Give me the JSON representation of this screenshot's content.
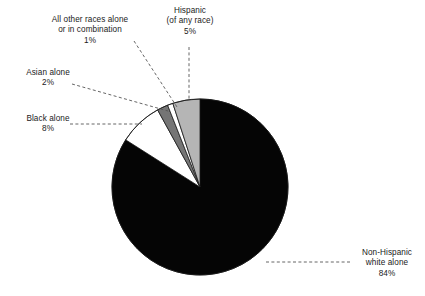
{
  "chart_data": {
    "type": "pie",
    "title": "",
    "subtitle": "",
    "xlabel": "",
    "ylabel": "",
    "legend_position": "callout-labels",
    "grid": false,
    "start_angle_deg": 0,
    "direction": "clockwise",
    "categories": [
      "Non-Hispanic white alone",
      "Black alone",
      "Asian alone",
      "All other races alone or in combination",
      "Hispanic (of any race)"
    ],
    "values": [
      84,
      8,
      2,
      1,
      5
    ],
    "value_suffix": "%",
    "slices": [
      {
        "id": "non-hispanic-white-alone",
        "name": "Non-Hispanic white alone",
        "value": 84,
        "value_text": "84%",
        "color": "#050505",
        "stroke": "#050505"
      },
      {
        "id": "black-alone",
        "name": "Black alone",
        "value": 8,
        "value_text": "8%",
        "color": "#ffffff",
        "stroke": "#1a1a1a"
      },
      {
        "id": "asian-alone",
        "name": "Asian alone",
        "value": 2,
        "value_text": "2%",
        "color": "#757575",
        "stroke": "#1a1a1a"
      },
      {
        "id": "all-other-races",
        "name": "All other races alone or in combination",
        "value": 1,
        "value_text": "1%",
        "color": "#ffffff",
        "stroke": "#1a1a1a"
      },
      {
        "id": "hispanic-any-race",
        "name": "Hispanic (of any race)",
        "value": 5,
        "value_text": "5%",
        "color": "#b5b5b5",
        "stroke": "#1a1a1a"
      }
    ]
  },
  "labels": {
    "all_other_races": {
      "line1": "All other races alone",
      "line2": "or in combination",
      "value": "1%"
    },
    "hispanic": {
      "line1": "Hispanic",
      "line2": "(of any race)",
      "value": "5%"
    },
    "asian": {
      "line1": "Asian alone",
      "value": "2%"
    },
    "black": {
      "line1": "Black alone",
      "value": "8%"
    },
    "non_hispanic_white": {
      "line1": "Non-Hispanic",
      "line2": "white alone",
      "value": "84%"
    }
  },
  "style": {
    "background": "#ffffff",
    "text_color": "#1a1a1a",
    "leader_line_color": "#555555"
  }
}
